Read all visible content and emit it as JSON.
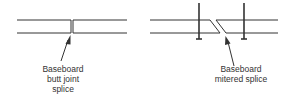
{
  "diagram": {
    "colors": {
      "line": "#333333",
      "text": "#333333",
      "background": "#ffffff"
    },
    "left": {
      "name": "butt-joint",
      "label_lines": [
        "Baseboard",
        "butt joint",
        "splice"
      ]
    },
    "right": {
      "name": "mitered-splice",
      "label_lines": [
        "Baseboard",
        "mitered splice"
      ]
    }
  }
}
